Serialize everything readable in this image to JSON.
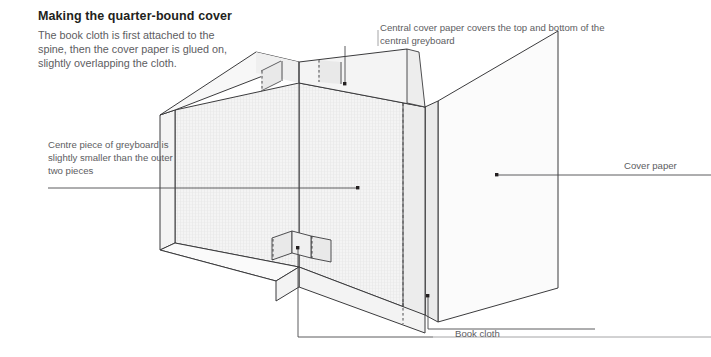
{
  "doc": {
    "title": "Making the quarter-bound cover",
    "intro": "The book cloth is first attached to the spine, then the cover paper is glued on, slightly overlapping the cloth."
  },
  "annotations": {
    "top_note": "Central cover paper covers the top and bottom of the central greyboard",
    "left_note": "Centre piece of greyboard is slightly smaller than the outer two pieces",
    "cover_paper": "Cover paper",
    "book_cloth": "Book cloth"
  },
  "diagram": {
    "type": "isometric-technical-illustration",
    "parts": [
      "left greyboard panel",
      "centre greyboard panel (spine)",
      "right greyboard panel",
      "book cloth strips at spine",
      "cover paper over boards"
    ],
    "colors": {
      "outline": "#3b3b3d",
      "leader": "#4a4a4c",
      "board_face": "#f2f2f2",
      "board_edge": "#e4e4e4",
      "cloth_strip": "#e8e8e8",
      "cover_paper": "#fbfbfb",
      "texture": "#d9d9d9",
      "text": "#5d5d5f",
      "title": "#231f20"
    }
  }
}
